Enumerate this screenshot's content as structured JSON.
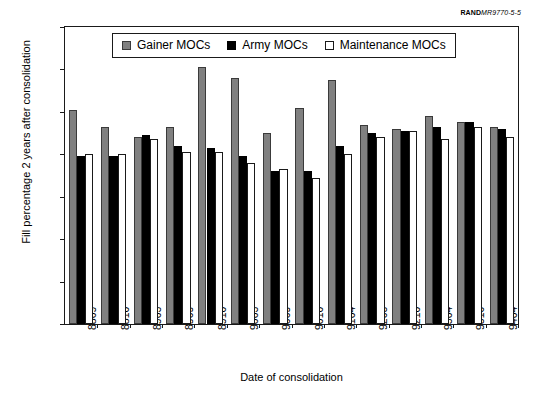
{
  "source_credit": {
    "mark": "RAND",
    "id": "MR9770-5-5"
  },
  "chart_data": {
    "type": "bar",
    "title": "",
    "xlabel": "Date of consolidation",
    "ylabel": "Fill percentage 2 years after consolidation",
    "ylim": [
      0,
      140
    ],
    "ytick_step": 20,
    "yticks": [
      0,
      20,
      40,
      60,
      80,
      100,
      120,
      140
    ],
    "grid": false,
    "legend_position": "top-center",
    "categories": [
      "8809",
      "8810",
      "8903",
      "8909",
      "8910",
      "9003",
      "9009",
      "9010",
      "9104",
      "9203",
      "9210",
      "9304",
      "9310",
      "9404"
    ],
    "series": [
      {
        "name": "Gainer MOCs",
        "color": "#808080",
        "values": [
          101,
          93,
          88,
          93,
          121,
          116,
          90,
          102,
          115,
          94,
          92,
          98,
          95,
          93
        ]
      },
      {
        "name": "Army MOCs",
        "color": "#000000",
        "values": [
          79,
          79,
          89,
          84,
          83,
          79,
          72,
          72,
          84,
          90,
          91,
          93,
          95,
          92
        ]
      },
      {
        "name": "Maintenance MOCs",
        "color": "#ffffff",
        "values": [
          80,
          80,
          87,
          81,
          81,
          76,
          73,
          69,
          80,
          88,
          91,
          87,
          93,
          88
        ]
      }
    ]
  }
}
